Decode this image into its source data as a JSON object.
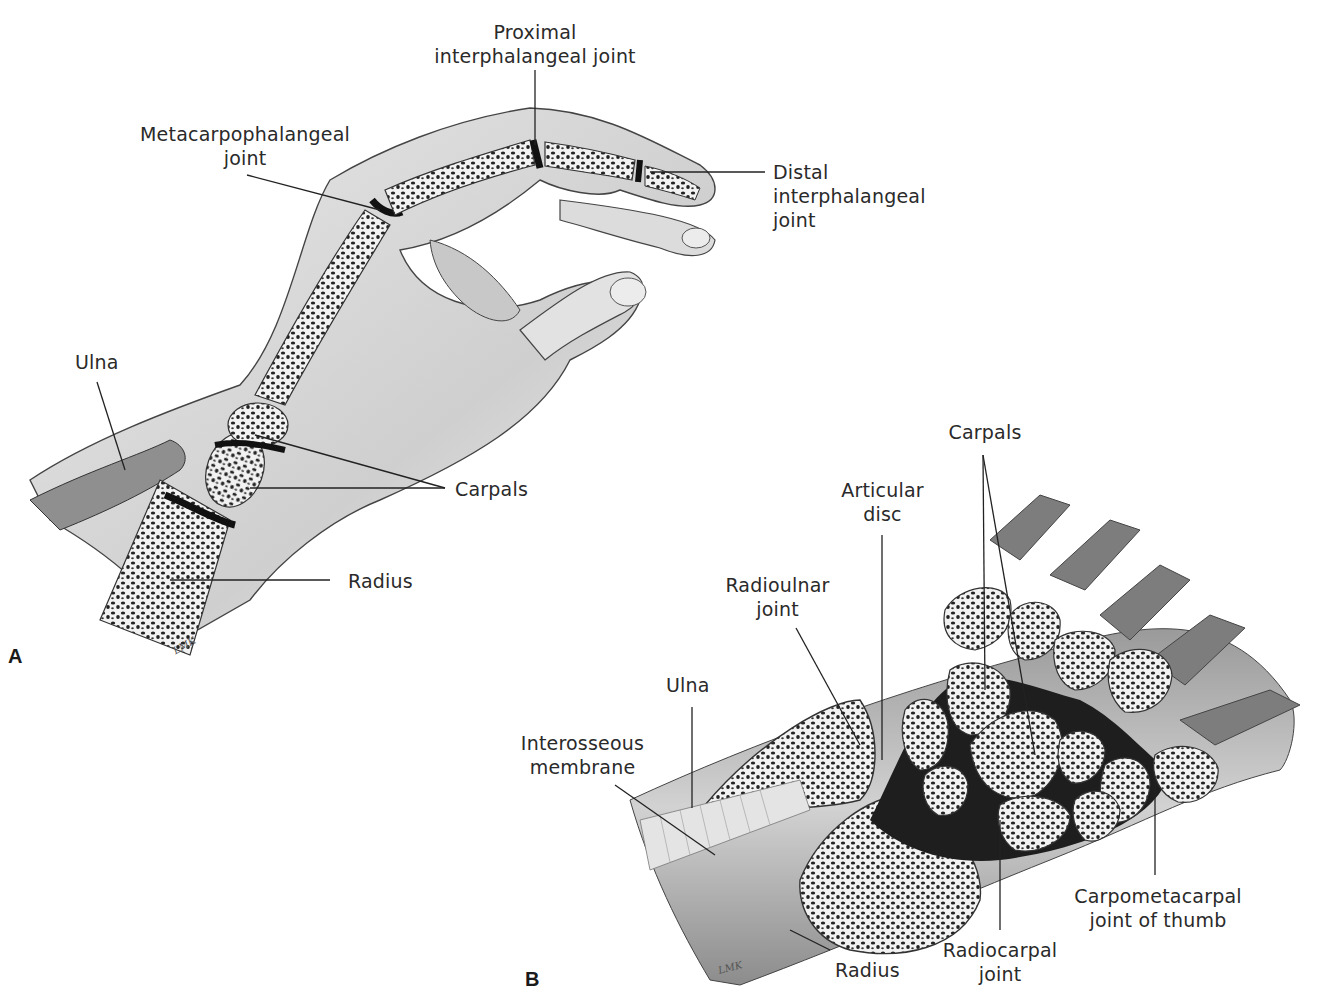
{
  "figure": {
    "panels": [
      {
        "id": "A",
        "label": "A",
        "signature": "LMK",
        "labels": {
          "proximal_ip": "Proximal\ninterphalangeal joint",
          "mcp": "Metacarpophalangeal\njoint",
          "distal_ip": "Distal\ninterphalangeal\njoint",
          "ulna": "Ulna",
          "carpals": "Carpals",
          "radius": "Radius"
        }
      },
      {
        "id": "B",
        "label": "B",
        "signature": "LMK",
        "labels": {
          "carpals": "Carpals",
          "articular_disc": "Articular\ndisc",
          "radioulnar_joint": "Radioulnar\njoint",
          "ulna": "Ulna",
          "interosseous_membrane": "Interosseous\nmembrane",
          "carpometacarpal": "Carpometacarpal\njoint of thumb",
          "radiocarpal": "Radiocarpal\njoint",
          "radius": "Radius"
        }
      }
    ],
    "colors": {
      "background": "#ffffff",
      "ink": "#2a2a2a",
      "skin_shade": "#d9d9d9",
      "bone_fill": "#f4f4f4",
      "cavity": "#1e1e1e"
    }
  }
}
